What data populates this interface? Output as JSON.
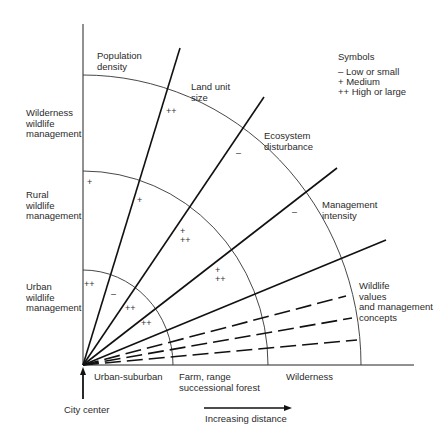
{
  "zones": {
    "urban": "Urban\nwildlife\nmanagement",
    "rural": "Rural\nwildlife\nmanagement",
    "wilderness": "Wilderness\nwildlife\nmanagement"
  },
  "axes": {
    "population_density": "Population\ndensity",
    "land_unit_size": "Land unit\nsize",
    "ecosystem_disturbance": "Ecosystem\ndisturbance",
    "management_intensity": "Management\nintensity",
    "wildlife_values": "Wildlife\nvalues\nand management\nconcepts"
  },
  "distance_bands": {
    "urban_suburban": "Urban-suburban",
    "farm": "Farm, range\nsuccessional forest",
    "wilderness": "Wilderness"
  },
  "city_center": "City center",
  "increasing_distance": "Increasing distance",
  "legend": {
    "title": "Symbols",
    "items": [
      "– Low or small",
      "+ Medium",
      "++ High or large"
    ]
  },
  "ratings": {
    "urban": {
      "population_density": "++",
      "land_unit_size": "–",
      "ecosystem_disturbance": "++",
      "management_intensity": "++"
    },
    "rural": {
      "population_density": "+",
      "land_unit_size": "+",
      "ecosystem_disturbance": "+\n++",
      "management_intensity": "+\n++"
    },
    "wilderness": {
      "population_density": "–",
      "land_unit_size": "++",
      "ecosystem_disturbance": "–",
      "management_intensity": "–"
    }
  }
}
